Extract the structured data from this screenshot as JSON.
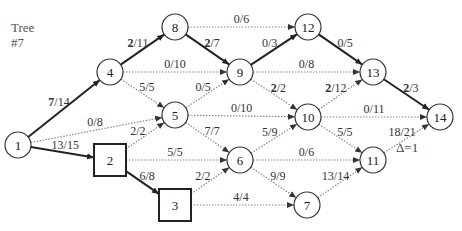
{
  "title": {
    "line1": "Tree",
    "line2": "#7"
  },
  "delta_label": "Δ=1",
  "colors": {
    "thick_edge": "#222222",
    "dotted_edge": "#888888",
    "node_stroke": "#333333",
    "text": "#333333"
  },
  "nodes": [
    {
      "id": "1",
      "x": 18,
      "y": 145,
      "shape": "circle"
    },
    {
      "id": "4",
      "x": 110,
      "y": 72,
      "shape": "circle"
    },
    {
      "id": "8",
      "x": 175,
      "y": 27,
      "shape": "circle"
    },
    {
      "id": "9",
      "x": 240,
      "y": 72,
      "shape": "circle"
    },
    {
      "id": "12",
      "x": 308,
      "y": 27,
      "shape": "circle"
    },
    {
      "id": "13",
      "x": 373,
      "y": 72,
      "shape": "circle"
    },
    {
      "id": "14",
      "x": 440,
      "y": 117,
      "shape": "circle"
    },
    {
      "id": "5",
      "x": 175,
      "y": 115,
      "shape": "circle"
    },
    {
      "id": "10",
      "x": 308,
      "y": 117,
      "shape": "circle"
    },
    {
      "id": "2",
      "x": 110,
      "y": 160,
      "shape": "square"
    },
    {
      "id": "6",
      "x": 240,
      "y": 160,
      "shape": "circle"
    },
    {
      "id": "11",
      "x": 373,
      "y": 160,
      "shape": "circle"
    },
    {
      "id": "3",
      "x": 175,
      "y": 205,
      "shape": "square"
    },
    {
      "id": "7",
      "x": 307,
      "y": 205,
      "shape": "circle"
    }
  ],
  "edges": [
    {
      "from": "1",
      "to": "4",
      "flow": "7",
      "cap": "14",
      "thick": true,
      "bold_flow": true
    },
    {
      "from": "1",
      "to": "5",
      "flow": "0",
      "cap": "8",
      "thick": false,
      "bold_flow": false
    },
    {
      "from": "1",
      "to": "2",
      "flow": "13",
      "cap": "15",
      "thick": true,
      "bold_flow": false
    },
    {
      "from": "4",
      "to": "8",
      "flow": "2",
      "cap": "11",
      "thick": true,
      "bold_flow": true
    },
    {
      "from": "4",
      "to": "9",
      "flow": "0",
      "cap": "10",
      "thick": false,
      "bold_flow": false
    },
    {
      "from": "4",
      "to": "5",
      "flow": "5",
      "cap": "5",
      "thick": false,
      "bold_flow": false
    },
    {
      "from": "8",
      "to": "12",
      "flow": "0",
      "cap": "6",
      "thick": false,
      "bold_flow": false
    },
    {
      "from": "8",
      "to": "9",
      "flow": "2",
      "cap": "7",
      "thick": true,
      "bold_flow": true
    },
    {
      "from": "9",
      "to": "12",
      "flow": "0",
      "cap": "3",
      "thick": true,
      "bold_flow": false
    },
    {
      "from": "9",
      "to": "13",
      "flow": "0",
      "cap": "8",
      "thick": false,
      "bold_flow": false
    },
    {
      "from": "9",
      "to": "10",
      "flow": "2",
      "cap": "2",
      "thick": false,
      "bold_flow": true
    },
    {
      "from": "5",
      "to": "9",
      "flow": "0",
      "cap": "5",
      "thick": false,
      "bold_flow": false
    },
    {
      "from": "5",
      "to": "10",
      "flow": "0",
      "cap": "10",
      "thick": false,
      "bold_flow": false
    },
    {
      "from": "5",
      "to": "6",
      "flow": "7",
      "cap": "7",
      "thick": false,
      "bold_flow": false
    },
    {
      "from": "12",
      "to": "13",
      "flow": "0",
      "cap": "5",
      "thick": true,
      "bold_flow": false
    },
    {
      "from": "13",
      "to": "14",
      "flow": "2",
      "cap": "3",
      "thick": true,
      "bold_flow": true
    },
    {
      "from": "10",
      "to": "13",
      "flow": "2",
      "cap": "12",
      "thick": false,
      "bold_flow": true
    },
    {
      "from": "10",
      "to": "14",
      "flow": "0",
      "cap": "11",
      "thick": false,
      "bold_flow": false
    },
    {
      "from": "10",
      "to": "11",
      "flow": "5",
      "cap": "5",
      "thick": false,
      "bold_flow": false
    },
    {
      "from": "2",
      "to": "5",
      "flow": "2",
      "cap": "2",
      "thick": false,
      "bold_flow": false
    },
    {
      "from": "2",
      "to": "6",
      "flow": "5",
      "cap": "5",
      "thick": false,
      "bold_flow": false
    },
    {
      "from": "2",
      "to": "3",
      "flow": "6",
      "cap": "8",
      "thick": true,
      "bold_flow": false
    },
    {
      "from": "6",
      "to": "10",
      "flow": "5",
      "cap": "9",
      "thick": false,
      "bold_flow": false
    },
    {
      "from": "6",
      "to": "11",
      "flow": "0",
      "cap": "6",
      "thick": false,
      "bold_flow": false
    },
    {
      "from": "6",
      "to": "7",
      "flow": "9",
      "cap": "9",
      "thick": false,
      "bold_flow": false
    },
    {
      "from": "3",
      "to": "6",
      "flow": "2",
      "cap": "2",
      "thick": false,
      "bold_flow": false
    },
    {
      "from": "3",
      "to": "7",
      "flow": "4",
      "cap": "4",
      "thick": false,
      "bold_flow": false
    },
    {
      "from": "11",
      "to": "14",
      "flow": "18",
      "cap": "21",
      "thick": false,
      "bold_flow": false
    },
    {
      "from": "7",
      "to": "11",
      "flow": "13",
      "cap": "14",
      "thick": false,
      "bold_flow": false
    }
  ]
}
